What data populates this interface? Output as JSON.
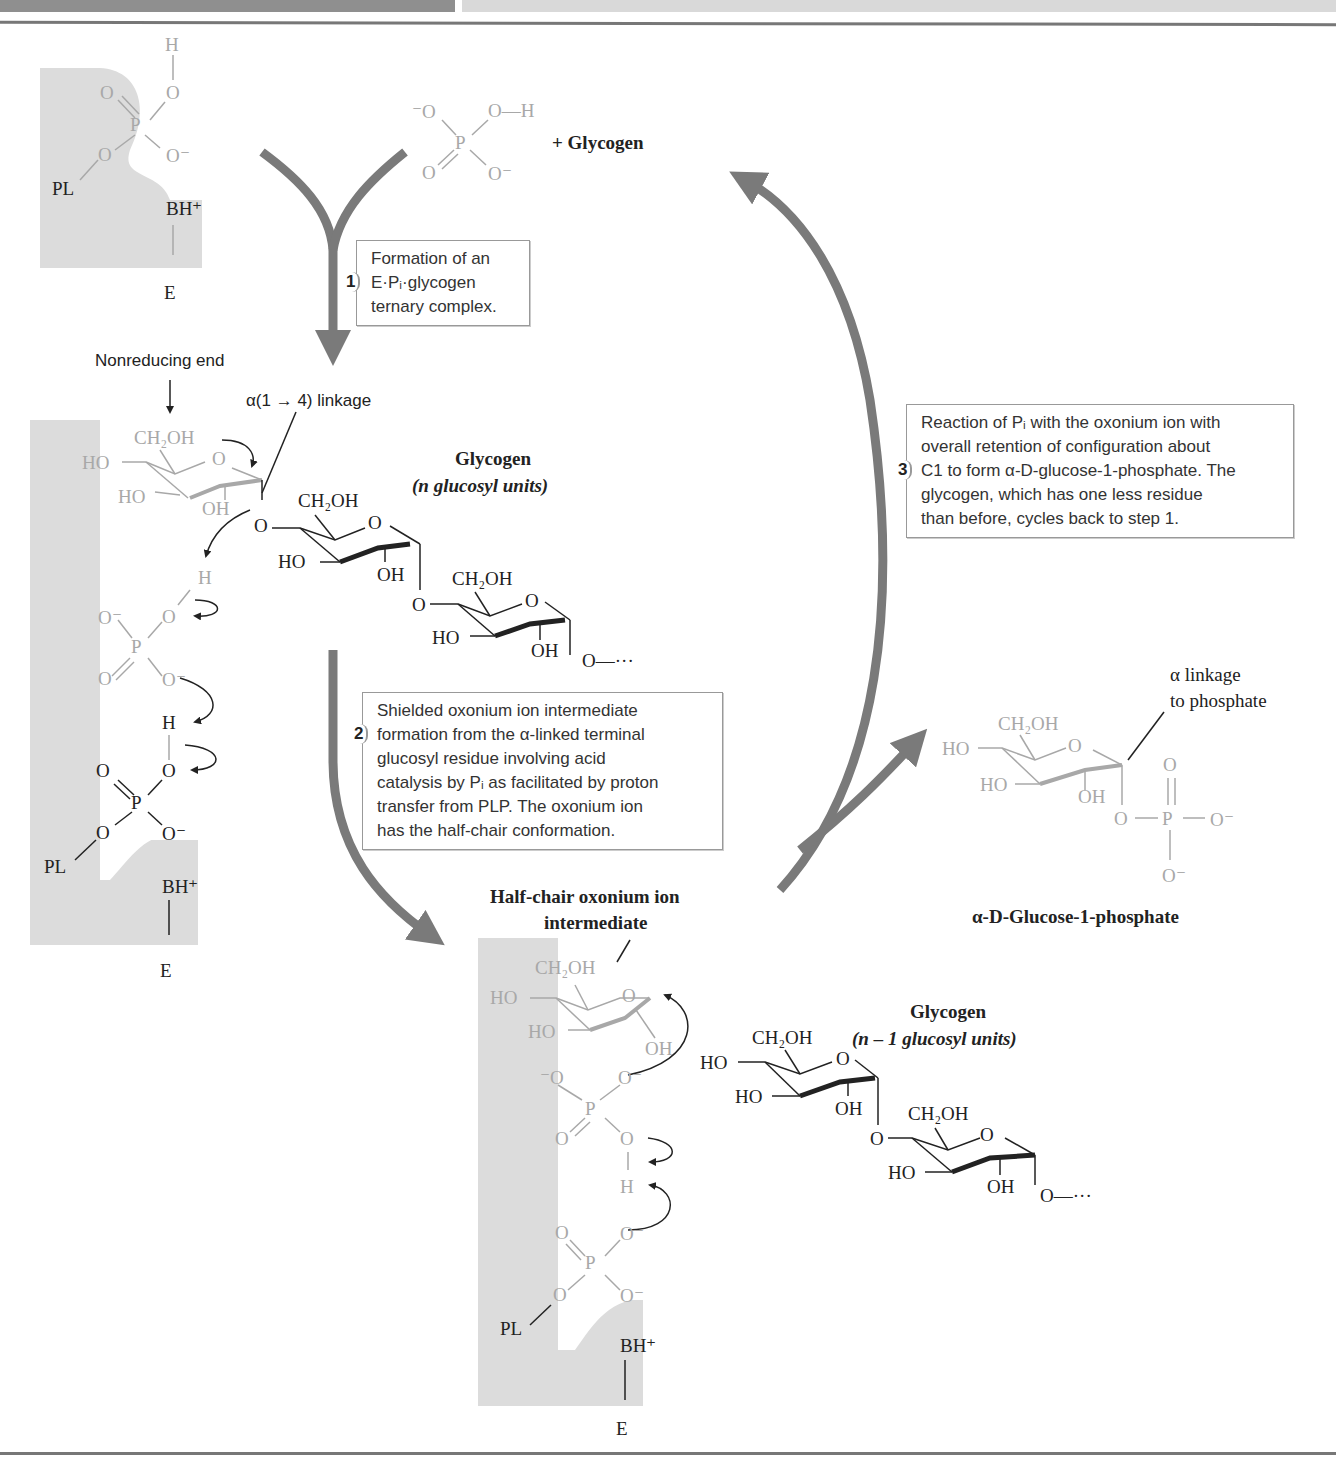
{
  "header": {
    "bar": "decorative page header bars"
  },
  "top_left_enzyme": {
    "labels": [
      "H",
      "O",
      "O",
      "P",
      "O",
      "O⁻",
      "PL",
      "BH⁺",
      "E"
    ]
  },
  "reactant": {
    "phosphate_labels": [
      "⁻O",
      "O—H",
      "P",
      "O",
      "O⁻"
    ],
    "plus_glycogen": "+ Glycogen"
  },
  "steps": [
    {
      "number": "1",
      "text_lines": [
        "Formation of an",
        "E·Pᵢ·glycogen",
        "ternary complex."
      ]
    },
    {
      "number": "2",
      "text_lines": [
        "Shielded oxonium ion intermediate",
        "formation from the α-linked terminal",
        "glucosyl residue involving acid",
        "catalysis by Pᵢ as facilitated by proton",
        "transfer from PLP. The oxonium ion",
        "has the half-chair conformation."
      ]
    },
    {
      "number": "3",
      "text_lines": [
        "Reaction of Pᵢ with the oxonium ion with",
        "overall retention of configuration about",
        "C1 to form α-D-glucose-1-phosphate. The",
        "glycogen, which has one less residue",
        "than before, cycles back to step 1."
      ]
    }
  ],
  "middle_left": {
    "nonreducing_end": "Nonreducing end",
    "linkage": "α(1 → 4) linkage",
    "glycogen_title": "Glycogen",
    "glycogen_sub": "(n glucosyl units)",
    "labels": {
      "ch2oh": "CH₂OH",
      "ho": "HO",
      "oh": "OH",
      "o": "O",
      "h": "H",
      "p": "P",
      "ominus": "O⁻",
      "pl": "PL",
      "bh": "BH⁺",
      "e": "E",
      "chain_end": "O—···"
    }
  },
  "intermediate": {
    "title_line1": "Half-chair oxonium ion",
    "title_line2": "intermediate",
    "glycogen_title": "Glycogen",
    "glycogen_sub": "(n – 1 glucosyl units)"
  },
  "product": {
    "linkage_label_1": "α linkage",
    "linkage_label_2": "to phosphate",
    "name": "α-D-Glucose-1-phosphate"
  },
  "colors": {
    "arrow": "#7a7a7a",
    "enzyme": "#dcdcdc",
    "faded": "#a8a8a8",
    "ink": "#222222"
  }
}
